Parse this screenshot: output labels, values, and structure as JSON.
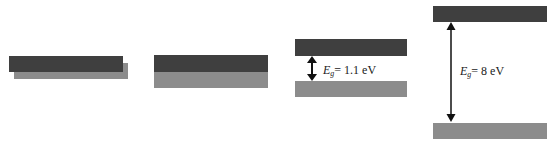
{
  "colors": {
    "conduction_band": "#3f3f3f",
    "valence_band": "#8c8c8c",
    "arrow": "#111111"
  },
  "panels": [
    {
      "id": "metal",
      "description": "overlapping bands",
      "bands": [
        {
          "role": "valence",
          "x": 14,
          "y": 63,
          "w": 114,
          "h": 16
        },
        {
          "role": "conduction",
          "x": 9,
          "y": 56,
          "w": 114,
          "h": 16
        }
      ]
    },
    {
      "id": "semimetal",
      "description": "touching bands",
      "bands": [
        {
          "role": "conduction",
          "x": 154,
          "y": 55,
          "w": 114,
          "h": 17
        },
        {
          "role": "valence",
          "x": 154,
          "y": 72,
          "w": 114,
          "h": 16
        }
      ]
    },
    {
      "id": "semiconductor",
      "bands": [
        {
          "role": "conduction",
          "x": 295,
          "y": 39,
          "w": 112,
          "h": 17
        },
        {
          "role": "valence",
          "x": 295,
          "y": 81,
          "w": 112,
          "h": 16
        }
      ],
      "gap": {
        "symbol": "E",
        "subscript": "g",
        "value": "= 1.1 eV",
        "arrow_x": 312,
        "arrow_y1": 57,
        "arrow_y2": 80,
        "label_x": 323,
        "label_y": 64
      }
    },
    {
      "id": "insulator",
      "bands": [
        {
          "role": "conduction",
          "x": 433,
          "y": 6,
          "w": 114,
          "h": 16
        },
        {
          "role": "valence",
          "x": 433,
          "y": 123,
          "w": 114,
          "h": 16
        }
      ],
      "gap": {
        "symbol": "E",
        "subscript": "g",
        "value": "= 8 eV",
        "arrow_x": 451,
        "arrow_y1": 23,
        "arrow_y2": 122,
        "label_x": 460,
        "label_y": 65
      }
    }
  ]
}
